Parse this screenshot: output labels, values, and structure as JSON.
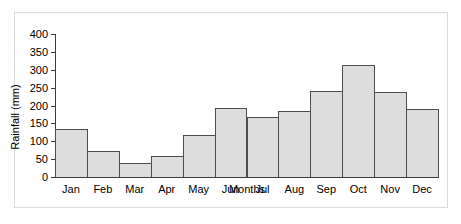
{
  "chart_data": {
    "type": "bar",
    "title": "",
    "xlabel": "Months",
    "ylabel": "Rainfall (mm)",
    "categories": [
      "Jan",
      "Feb",
      "Mar",
      "Apr",
      "May",
      "Jun",
      "Jul",
      "Aug",
      "Sep",
      "Oct",
      "Nov",
      "Dec"
    ],
    "values": [
      135,
      74,
      39,
      60,
      117,
      194,
      168,
      186,
      242,
      313,
      238,
      190
    ],
    "ylim": [
      0,
      400
    ],
    "ytick_labels": [
      "0",
      "50",
      "100",
      "150",
      "200",
      "250",
      "300",
      "350",
      "400"
    ],
    "ytick_values": [
      0,
      50,
      100,
      150,
      200,
      250,
      300,
      350,
      400
    ],
    "grid": false,
    "legend": null,
    "legend_position": "none",
    "bar_fill_color": "#dddddd",
    "bar_edge_color": "#4d4d4d",
    "axis_color": "#3d3d3d",
    "background_color": "#ffffff",
    "frame_color": "#dadada"
  }
}
